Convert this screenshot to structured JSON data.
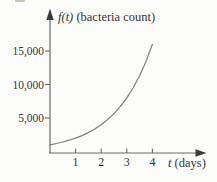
{
  "figure": {
    "y_axis_title_var": "f(t)",
    "y_axis_title_rest": " (bacteria count)",
    "x_axis_title_var": "t",
    "x_axis_title_rest": " (days)",
    "text_color": "#3a3632"
  },
  "chart_data": {
    "type": "line",
    "title": "",
    "ylabel": "f(t) (bacteria count)",
    "xlabel": "t (days)",
    "x": [
      0,
      0.25,
      0.5,
      0.75,
      1,
      1.25,
      1.5,
      1.75,
      2,
      2.25,
      2.5,
      2.75,
      3,
      3.25,
      3.5,
      3.75,
      4
    ],
    "y": [
      1000,
      1189,
      1414,
      1682,
      2000,
      2378,
      2828,
      3364,
      4000,
      4757,
      5657,
      6727,
      8000,
      9514,
      11314,
      13454,
      16000
    ],
    "x_ticks": [
      {
        "value": 1,
        "label": "1"
      },
      {
        "value": 2,
        "label": "2"
      },
      {
        "value": 3,
        "label": "3"
      },
      {
        "value": 4,
        "label": "4"
      }
    ],
    "y_ticks": [
      {
        "value": 5000,
        "label": "5,000"
      },
      {
        "value": 10000,
        "label": "10,000"
      },
      {
        "value": 15000,
        "label": "15,000"
      }
    ],
    "xlim": [
      0,
      4.6
    ],
    "ylim": [
      0,
      20500
    ],
    "grid": false,
    "axis_color": "#6a6a6a",
    "arrow_color": "#3b3b3b",
    "line_color": "#7d7d7d"
  }
}
